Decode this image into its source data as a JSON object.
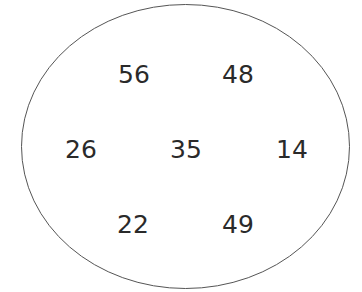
{
  "diagram": {
    "shape": "ellipse",
    "stroke_color": "#555555",
    "fill_color": "#ffffff",
    "numbers": [
      {
        "value": "56",
        "position": "top-left"
      },
      {
        "value": "48",
        "position": "top-right"
      },
      {
        "value": "26",
        "position": "middle-left"
      },
      {
        "value": "35",
        "position": "center"
      },
      {
        "value": "14",
        "position": "middle-right"
      },
      {
        "value": "22",
        "position": "bottom-left"
      },
      {
        "value": "49",
        "position": "bottom-right"
      }
    ]
  }
}
